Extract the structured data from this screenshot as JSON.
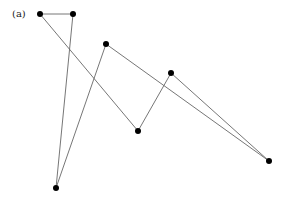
{
  "figure": {
    "panel_label": "(a)",
    "nodes": [
      {
        "id": "n1"
      },
      {
        "id": "n2"
      },
      {
        "id": "n3"
      },
      {
        "id": "n4"
      },
      {
        "id": "n5"
      },
      {
        "id": "n6"
      },
      {
        "id": "n7"
      }
    ],
    "edges": [
      [
        "n1",
        "n2"
      ],
      [
        "n2",
        "n3"
      ],
      [
        "n3",
        "n4"
      ],
      [
        "n4",
        "n5"
      ],
      [
        "n5",
        "n6"
      ],
      [
        "n6",
        "n7"
      ],
      [
        "n7",
        "n1"
      ]
    ],
    "colors": {
      "node": "#000000",
      "edge": "#666666"
    }
  }
}
